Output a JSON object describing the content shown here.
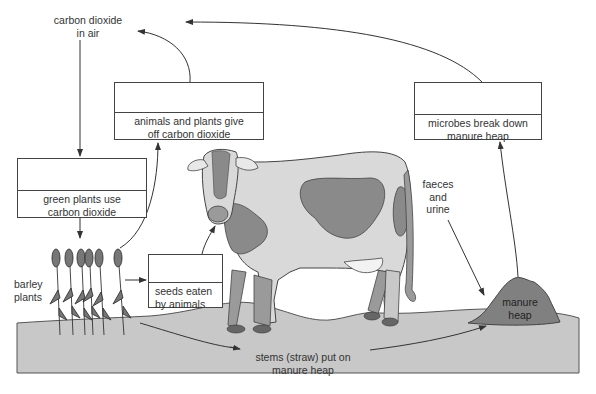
{
  "diagram": {
    "labels": {
      "co2_air_line1": "carbon dioxide",
      "co2_air_line2": "in air",
      "barley_line1": "barley",
      "barley_line2": "plants",
      "faeces_line1": "faeces",
      "faeces_line2": "and",
      "faeces_line3": "urine",
      "manure_line1": "manure",
      "manure_line2": "heap",
      "stems_line1": "stems (straw) put on",
      "stems_line2": "manure heap"
    },
    "boxes": [
      {
        "id": "animals-plants-give-off",
        "line1": "animals and plants give",
        "line2": "off carbon dioxide",
        "answer_blank": ""
      },
      {
        "id": "microbes-break-down",
        "line1": "microbes break down",
        "line2": "manure heap",
        "answer_blank": ""
      },
      {
        "id": "green-plants-use",
        "line1": "green plants use",
        "line2": "carbon dioxide",
        "answer_blank": ""
      },
      {
        "id": "seeds-eaten",
        "line1": "seeds eaten",
        "line2": "by animals",
        "answer_blank": ""
      }
    ],
    "colors": {
      "ground": "#c8c8c8",
      "cow_body": "#d9d9d9",
      "cow_patch": "#8a8a8a",
      "manure": "#7f7f7f",
      "line": "#333333"
    }
  }
}
